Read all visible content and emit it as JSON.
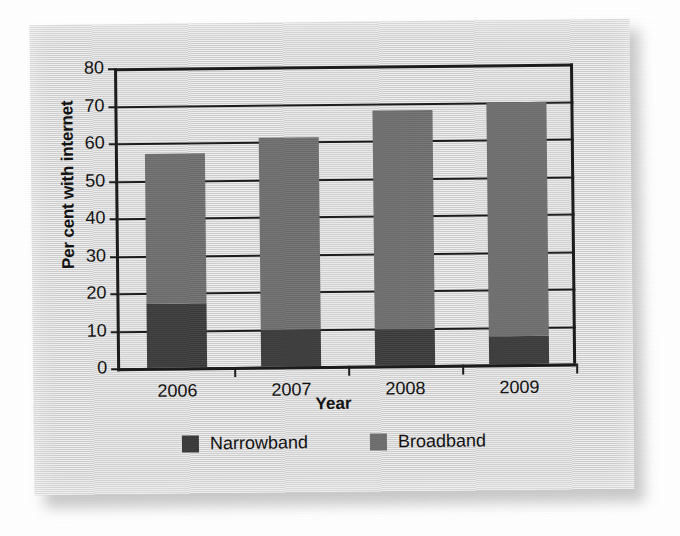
{
  "chart_data": {
    "type": "bar",
    "subtype": "stacked-bar",
    "title": "",
    "xlabel": "Year",
    "ylabel": "Per cent with internet",
    "categories": [
      "2006",
      "2007",
      "2008",
      "2009"
    ],
    "series": [
      {
        "name": "Narrowband",
        "color": "#3b3b3b",
        "values": [
          17,
          10,
          9.5,
          7.5
        ]
      },
      {
        "name": "Broadband",
        "color": "#6e6e6e",
        "values": [
          40,
          51,
          58.5,
          62.5
        ]
      }
    ],
    "totals": [
      57,
      61,
      68,
      70
    ],
    "ylim": [
      0,
      80
    ],
    "ytick_step": 10,
    "yticks": [
      80,
      70,
      60,
      50,
      40,
      30,
      20,
      10,
      0
    ],
    "grid": true,
    "legend_position": "bottom"
  },
  "legend": {
    "items": [
      {
        "label": "Narrowband",
        "swatch": "narrowband-swatch",
        "color": "#3b3b3b"
      },
      {
        "label": "Broadband",
        "swatch": "broadband-swatch",
        "color": "#6e6e6e"
      }
    ]
  },
  "colors": {
    "card_background": "#d7d7d7",
    "plot_background": "#d7d7d7",
    "axis": "#1b1b1b",
    "narrowband": "#3b3b3b",
    "broadband": "#6e6e6e",
    "page_background": "#ffffff"
  }
}
